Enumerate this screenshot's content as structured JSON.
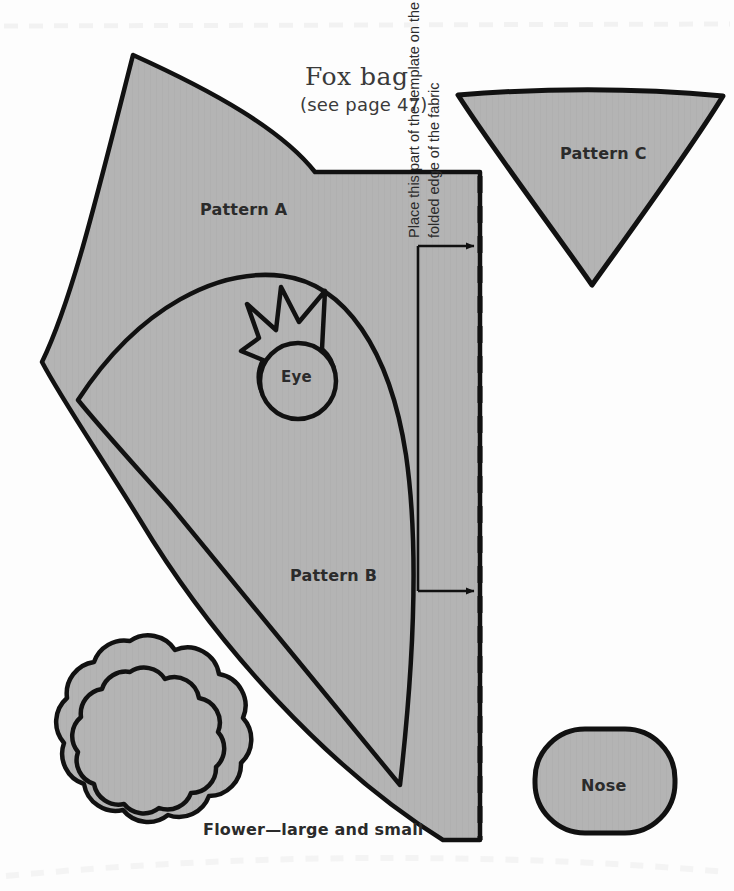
{
  "page": {
    "width": 734,
    "height": 891,
    "background_color": "#fdfdfd",
    "shape_fill": "#b4b4b4",
    "outline_color": "#111111",
    "text_color": "#2b2b2b"
  },
  "title": {
    "main": "Fox bag",
    "subtitle": "(see page 47)"
  },
  "labels": {
    "pattern_a": "Pattern A",
    "pattern_b": "Pattern B",
    "pattern_c": "Pattern C",
    "eye": "Eye",
    "nose": "Nose",
    "flower": "Flower—large and small"
  },
  "fold_instruction": {
    "line1": "Place this part of the template on the",
    "line2": "folded edge of the fabric"
  },
  "pieces": [
    {
      "name": "pattern-a",
      "label": "Pattern A",
      "description": "large fan-shaped body panel with concave top edge and straight right fold edge"
    },
    {
      "name": "pattern-b",
      "label": "Pattern B",
      "description": "inner curved panel nested inside pattern A"
    },
    {
      "name": "eye",
      "label": "Eye",
      "description": "circle with spiked crown/eyelash shape on top"
    },
    {
      "name": "pattern-c",
      "label": "Pattern C",
      "description": "inverted triangle with slightly concave sides"
    },
    {
      "name": "flower",
      "label": "Flower—large and small",
      "description": "two concentric eight-petal flower outlines"
    },
    {
      "name": "nose",
      "label": "Nose",
      "description": "rounded rectangle / oval shape"
    }
  ],
  "fold_line": {
    "style": "dashed",
    "orientation": "vertical",
    "arrow_count": 2,
    "arrow_direction": "right"
  }
}
